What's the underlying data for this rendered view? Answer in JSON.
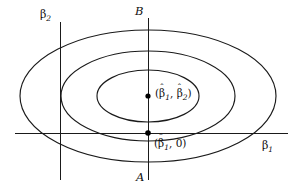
{
  "figure": {
    "background_color": "#ffffff",
    "line_color": "#1a1a1a",
    "marker_color": "#000000",
    "width": 299,
    "height": 193
  },
  "axes": {
    "horizontal": {
      "label": "β",
      "subscript": "1",
      "y": 133,
      "x_start": 15,
      "x_end": 288
    },
    "vertical": {
      "label": "β",
      "subscript": "2",
      "x": 60,
      "y_start": 22,
      "y_end": 180
    }
  },
  "guide_line": {
    "name": "line-AB",
    "x": 148,
    "y_start": 18,
    "y_end": 180,
    "top_label": "B",
    "bottom_label": "A"
  },
  "contours": [
    {
      "name": "outer-ellipse",
      "cx": 148,
      "cy": 96,
      "rx": 128,
      "ry": 66
    },
    {
      "name": "middle-ellipse",
      "cx": 148,
      "cy": 96,
      "rx": 87,
      "ry": 45
    },
    {
      "name": "inner-ellipse",
      "cx": 148,
      "cy": 96,
      "rx": 51,
      "ry": 26
    }
  ],
  "points": [
    {
      "name": "unconstrained-estimate",
      "cx": 148,
      "cy": 96,
      "label_open": "(",
      "label_beta": "β",
      "label_hat": "ˆ",
      "label_sub1": "1",
      "label_comma": ", ",
      "label_beta2": "β",
      "label_sub2": "2",
      "label_close": ")"
    },
    {
      "name": "restricted-estimate",
      "cx": 148,
      "cy": 133,
      "label_open": "(",
      "label_beta": "β",
      "label_hat": "ˆ",
      "label_sub1": "1",
      "label_comma": ", ",
      "label_zero": "0",
      "label_close": ")"
    }
  ],
  "chart_data": {
    "type": "contour",
    "xlabel": "β1",
    "ylabel": "β2",
    "center": {
      "x": 148,
      "y": 96
    },
    "ellipse_radii": [
      {
        "rx": 128,
        "ry": 66
      },
      {
        "rx": 87,
        "ry": 45
      },
      {
        "rx": 51,
        "ry": 26
      }
    ],
    "annotated_points": [
      {
        "label": "(β̂1, β̂2)",
        "x": 148,
        "y": 96
      },
      {
        "label": "(β̂1, 0)",
        "x": 148,
        "y": 133
      }
    ],
    "reference_lines": [
      {
        "label": "AB",
        "orientation": "vertical",
        "x": 148
      },
      {
        "label": "β2 axis",
        "orientation": "vertical",
        "x": 60
      },
      {
        "label": "β1 axis",
        "orientation": "horizontal",
        "y": 133
      }
    ],
    "grid": false,
    "legend": "none"
  }
}
